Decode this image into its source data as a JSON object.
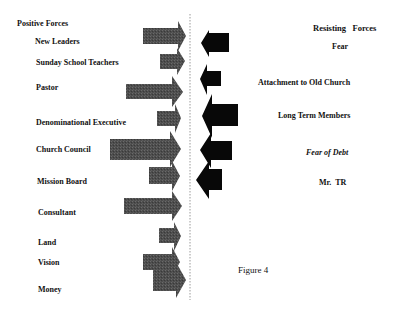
{
  "diagram": {
    "type": "force-field-analysis",
    "caption": "Figure 4",
    "divider_color": "#9a9a9a",
    "positive": {
      "heading": "Positive Forces",
      "arrow_color": "#4a4a4a",
      "items": [
        {
          "label": "New Leaders"
        },
        {
          "label": "Sunday School Teachers"
        },
        {
          "label": "Pastor"
        },
        {
          "label": "Denominational Executive"
        },
        {
          "label": "Church Council"
        },
        {
          "label": "Mission Board"
        },
        {
          "label": "Consultant"
        },
        {
          "label": "Land"
        },
        {
          "label": "Vision"
        },
        {
          "label": "Money"
        }
      ]
    },
    "resisting": {
      "heading": "Resisting   Forces",
      "arrow_color": "#080808",
      "items": [
        {
          "label": "Fear"
        },
        {
          "label": "Attachment to Old Church"
        },
        {
          "label": "Long Term Members"
        },
        {
          "label": "Fear of Debt"
        },
        {
          "label": "Mr.  TR"
        }
      ]
    }
  }
}
